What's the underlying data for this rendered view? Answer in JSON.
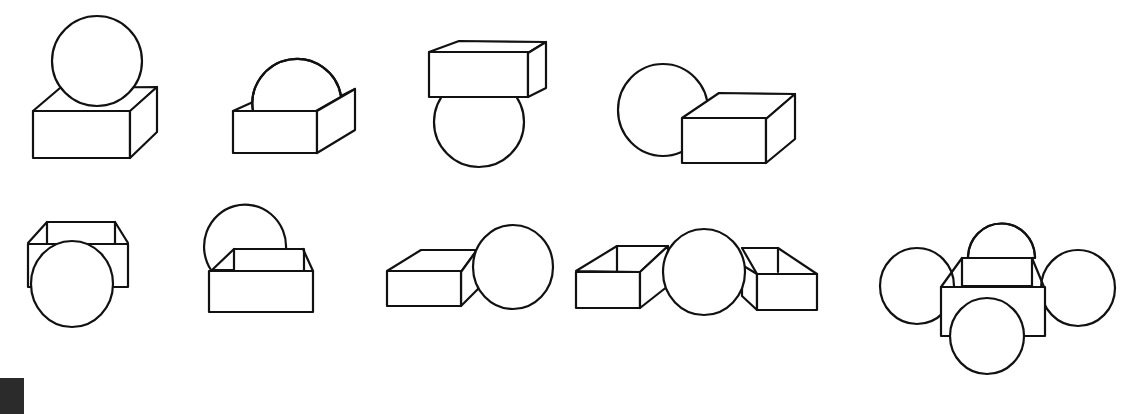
{
  "figure": {
    "type": "spatial-reasoning-line-drawings",
    "background": "#ffffff",
    "stroke_color": "#111111",
    "rows": [
      {
        "row": 1,
        "items": [
          {
            "index": 1,
            "description": "sphere resting on top of a closed box"
          },
          {
            "index": 2,
            "description": "sphere sitting inside an open-top box, upper half visible"
          },
          {
            "index": 3,
            "description": "closed box resting on top of a sphere"
          },
          {
            "index": 4,
            "description": "sphere behind and left of a closed box"
          }
        ]
      },
      {
        "row": 2,
        "items": [
          {
            "index": 5,
            "description": "sphere in front of an open-top box"
          },
          {
            "index": 6,
            "description": "sphere behind an open-top box"
          },
          {
            "index": 7,
            "description": "closed box left of a sphere, sphere in front"
          },
          {
            "index": 8,
            "description": "sphere between two open-top boxes"
          },
          {
            "index": 9,
            "description": "open-top box surrounded by four spheres (behind, left, right, front)"
          }
        ]
      }
    ],
    "corner_marker": {
      "color": "#2b2b2b",
      "position": "bottom-left"
    }
  }
}
